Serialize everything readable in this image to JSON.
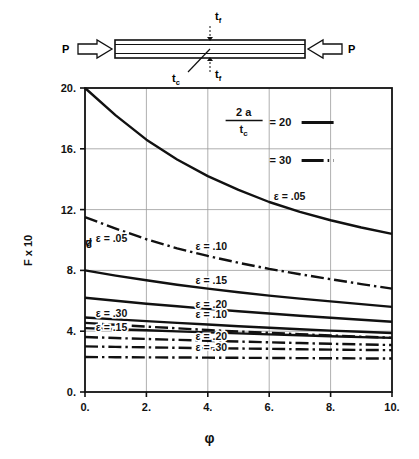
{
  "figure": {
    "specimen": {
      "load_left_label": "P",
      "load_right_label": "P",
      "face_thickness_top_label": "t",
      "face_thickness_top_sub": "f",
      "face_thickness_bottom_label": "t",
      "face_thickness_bottom_sub": "f",
      "core_label": "t",
      "core_sub": "c"
    }
  },
  "chart_data": {
    "type": "line",
    "title": "",
    "xlabel": "φ",
    "ylabel": "Fₚ x 10²",
    "ylabel_base": "F",
    "ylabel_sub": "p",
    "ylabel_factor": "x 10",
    "ylabel_exp": "2",
    "xlim": [
      0,
      10
    ],
    "ylim": [
      0,
      20
    ],
    "xticks": [
      "0.",
      "2.",
      "4.",
      "6.",
      "8.",
      "10."
    ],
    "xtick_values": [
      0,
      2,
      4,
      6,
      8,
      10
    ],
    "yticks": [
      "0.",
      "4.",
      "8.",
      "12.",
      "16.",
      "20."
    ],
    "ytick_values": [
      0,
      4,
      8,
      12,
      16,
      20
    ],
    "grid": true,
    "legend": {
      "position": "top-right-inside",
      "ratio_numerator": "2 a",
      "ratio_denominator_base": "t",
      "ratio_denominator_sub": "c",
      "entries": [
        {
          "label": "= 20",
          "style": "solid"
        },
        {
          "label": "= 30",
          "style": "dash-dot"
        }
      ]
    },
    "series": [
      {
        "name": "ε = .05, 2a/tc = 20",
        "label": "ε =  .05",
        "epsilon": 0.05,
        "ratio": 20,
        "style": "solid",
        "label_xy": [
          6.15,
          12.6
        ],
        "x": [
          0,
          1,
          2,
          3,
          4,
          5,
          6,
          7,
          8,
          9,
          10
        ],
        "y": [
          20.0,
          18.2,
          16.6,
          15.3,
          14.2,
          13.3,
          12.5,
          11.85,
          11.3,
          10.82,
          10.4
        ]
      },
      {
        "name": "ε = .05, 2a/tc = 30",
        "label": "ε =  .05",
        "epsilon": 0.05,
        "ratio": 30,
        "style": "dash-dot",
        "label_xy": [
          0.35,
          9.9
        ],
        "x": [
          0,
          1,
          2,
          3,
          4,
          5,
          6,
          7,
          8,
          9,
          10
        ],
        "y": [
          11.5,
          10.75,
          10.05,
          9.45,
          8.95,
          8.5,
          8.1,
          7.75,
          7.42,
          7.1,
          6.8
        ]
      },
      {
        "name": "ε = .10, 2a/tc = 20",
        "label": "ε =  .10",
        "epsilon": 0.1,
        "ratio": 20,
        "style": "solid",
        "label_xy": [
          3.6,
          9.35
        ],
        "x": [
          0,
          1,
          2,
          3,
          4,
          5,
          6,
          7,
          8,
          9,
          10
        ],
        "y": [
          8.0,
          7.66,
          7.35,
          7.06,
          6.8,
          6.56,
          6.34,
          6.14,
          5.96,
          5.78,
          5.6
        ]
      },
      {
        "name": "ε = .15, 2a/tc = 20",
        "label": "ε =  .15",
        "epsilon": 0.15,
        "ratio": 20,
        "style": "solid",
        "label_xy": [
          3.6,
          7.1
        ],
        "x": [
          0,
          1,
          2,
          3,
          4,
          5,
          6,
          7,
          8,
          9,
          10
        ],
        "y": [
          6.2,
          6.0,
          5.81,
          5.64,
          5.47,
          5.31,
          5.16,
          5.02,
          4.88,
          4.75,
          4.62
        ]
      },
      {
        "name": "ε = .20, 2a/tc = 20",
        "label": "ε =  .20",
        "epsilon": 0.2,
        "ratio": 20,
        "style": "solid",
        "label_xy": [
          3.6,
          5.55
        ],
        "x": [
          0,
          1,
          2,
          3,
          4,
          5,
          6,
          7,
          8,
          9,
          10
        ],
        "y": [
          4.9,
          4.78,
          4.66,
          4.55,
          4.44,
          4.33,
          4.23,
          4.13,
          4.04,
          3.96,
          3.88
        ]
      },
      {
        "name": "ε = .30, 2a/tc = 20",
        "label": "ε =  .30",
        "epsilon": 0.3,
        "ratio": 20,
        "style": "solid",
        "label_xy": [
          0.35,
          4.95
        ],
        "x": [
          0,
          1,
          2,
          3,
          4,
          5,
          6,
          7,
          8,
          9,
          10
        ],
        "y": [
          4.2,
          4.13,
          4.06,
          3.99,
          3.92,
          3.86,
          3.79,
          3.73,
          3.67,
          3.61,
          3.56
        ]
      },
      {
        "name": "ε = .10, 2a/tc = 30",
        "label": "ε =  .10",
        "epsilon": 0.1,
        "ratio": 30,
        "style": "dash-dot",
        "label_xy": [
          3.6,
          4.85
        ],
        "x": [
          0,
          1,
          2,
          3,
          4,
          5,
          6,
          7,
          8,
          9,
          10
        ],
        "y": [
          4.55,
          4.42,
          4.3,
          4.19,
          4.08,
          3.98,
          3.89,
          3.8,
          3.72,
          3.64,
          3.57
        ]
      },
      {
        "name": "ε = .15, 2a/tc = 30",
        "label": "ε =  .15",
        "epsilon": 0.15,
        "ratio": 30,
        "style": "dash-dot",
        "label_xy": [
          0.35,
          4.0
        ],
        "x": [
          0,
          1,
          2,
          3,
          4,
          5,
          6,
          7,
          8,
          9,
          10
        ],
        "y": [
          3.62,
          3.55,
          3.49,
          3.43,
          3.37,
          3.32,
          3.27,
          3.22,
          3.17,
          3.13,
          3.09
        ]
      },
      {
        "name": "ε = .20, 2a/tc = 30",
        "label": "ε =  .20",
        "epsilon": 0.2,
        "ratio": 30,
        "style": "dash-dot",
        "label_xy": [
          3.6,
          3.45
        ],
        "x": [
          0,
          1,
          2,
          3,
          4,
          5,
          6,
          7,
          8,
          9,
          10
        ],
        "y": [
          3.0,
          2.97,
          2.94,
          2.91,
          2.88,
          2.86,
          2.84,
          2.81,
          2.79,
          2.77,
          2.75
        ]
      },
      {
        "name": "ε = .30, 2a/tc = 30",
        "label": "ε =  .30",
        "epsilon": 0.3,
        "ratio": 30,
        "style": "dash-dot",
        "label_xy": [
          3.6,
          2.72
        ],
        "x": [
          0,
          1,
          2,
          3,
          4,
          5,
          6,
          7,
          8,
          9,
          10
        ],
        "y": [
          2.3,
          2.29,
          2.28,
          2.27,
          2.26,
          2.25,
          2.24,
          2.23,
          2.22,
          2.21,
          2.2
        ]
      }
    ]
  },
  "colors": {
    "ink": "#111111",
    "grid": "#9a9a9a",
    "axis": "#111111"
  }
}
